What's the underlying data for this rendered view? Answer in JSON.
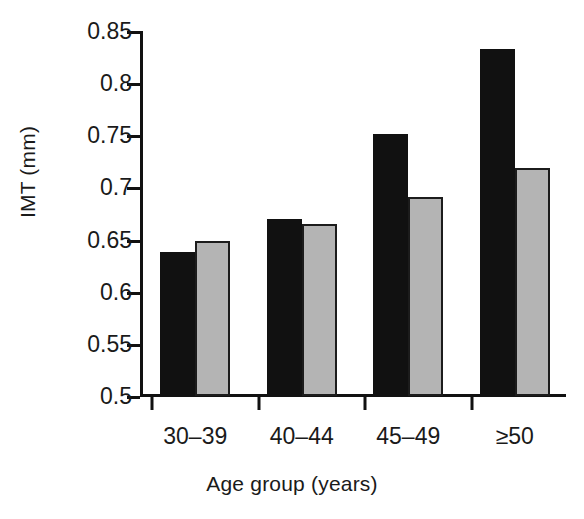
{
  "chart_data": {
    "type": "bar",
    "title": "",
    "xlabel": "Age group (years)",
    "ylabel": "IMT (mm)",
    "categories": [
      "30–39",
      "40–44",
      "45–49",
      "≥50"
    ],
    "series": [
      {
        "name": "black",
        "color": "#111111",
        "values": [
          0.638,
          0.67,
          0.751,
          0.833
        ]
      },
      {
        "name": "gray",
        "color": "#b4b4b4",
        "values": [
          0.649,
          0.665,
          0.691,
          0.719
        ]
      }
    ],
    "ylim": [
      0.5,
      0.85
    ],
    "ytick_values": [
      0.5,
      0.55,
      0.6,
      0.65,
      0.7,
      0.75,
      0.8,
      0.85
    ],
    "ytick_labels": [
      "0.5",
      "0.55",
      "0.6",
      "0.65",
      "0.7",
      "0.75",
      "0.8",
      "0.85"
    ],
    "grid": false,
    "legend": "none"
  }
}
